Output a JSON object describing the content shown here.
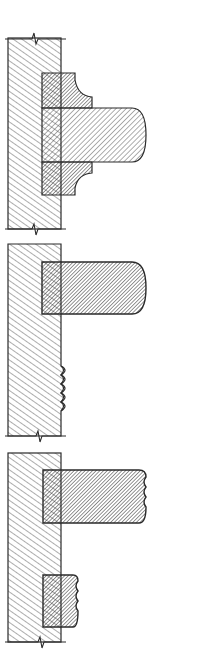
{
  "figure": {
    "background": "#ffffff",
    "stroke_color": "#2a2a2a",
    "wall_hatch_color": "#4a4a4a",
    "molding_hatch_color": "#2a2a2a",
    "details": [
      {
        "id": "detail-1",
        "label": "Bullnose shelf with cove moldings above and below"
      },
      {
        "id": "detail-2",
        "label": "Bullnose shelf with scalloped wall edge"
      },
      {
        "id": "detail-3",
        "label": "Reeded shelf with small reeded molding below"
      }
    ]
  }
}
